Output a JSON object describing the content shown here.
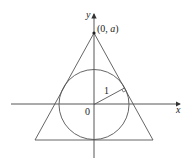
{
  "diagram": {
    "colors": {
      "stroke": "#555555",
      "axis": "#444444",
      "text": "#222222",
      "background": "#ffffff"
    },
    "axes": {
      "x_label": "x",
      "y_label": "y",
      "origin_label": "0"
    },
    "apex": {
      "label": "(0, a)",
      "label_prefix": "(0, ",
      "label_var": "a",
      "label_suffix": ")"
    },
    "circle": {
      "radius_label": "1"
    }
  }
}
